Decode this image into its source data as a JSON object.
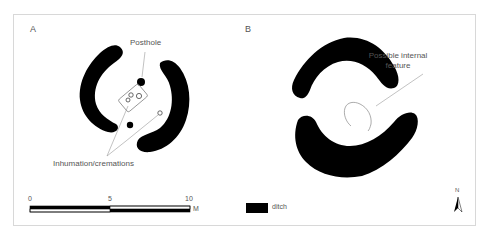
{
  "figure": {
    "panels": [
      {
        "id": "A",
        "letter": "A",
        "annotations": {
          "posthole": "Posthole",
          "burials": "Inhumation/cremations"
        },
        "scale_bar": {
          "ticks": [
            "0",
            "5",
            "10"
          ],
          "unit": "M"
        }
      },
      {
        "id": "B",
        "letter": "B",
        "annotations": {
          "feature_line1": "Possible internal",
          "feature_line2": "feature"
        }
      }
    ],
    "legend": {
      "items": [
        {
          "swatch_color": "#000000",
          "label": "ditch"
        }
      ]
    },
    "north_arrow": {
      "label": "N"
    }
  },
  "colors": {
    "ditch": "#000000",
    "frame": "#d8d8d8",
    "leader_line": "#999999",
    "text": "#555555"
  }
}
